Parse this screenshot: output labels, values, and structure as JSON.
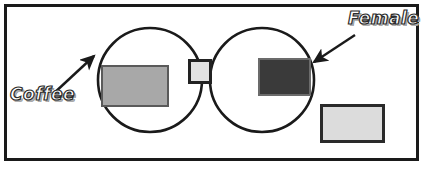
{
  "diagram": {
    "type": "venn-diagram",
    "title_visible": false,
    "set_count": 2,
    "frame": {
      "border_color": "#1a1a1a",
      "background_color": "#ffffff"
    },
    "labels": [
      {
        "id": "coffee",
        "text": "Coffee",
        "style": "bold-italic-outline-wordart",
        "points_to": "left-circle"
      },
      {
        "id": "female",
        "text": "Female",
        "style": "bold-italic-outline-wordart",
        "points_to": "right-circle"
      }
    ],
    "circles": [
      {
        "id": "left-circle",
        "label": "Coffee",
        "center_x": 150,
        "center_y": 80,
        "radius": 52,
        "stroke_color": "#1a1a1a",
        "fill": "none"
      },
      {
        "id": "right-circle",
        "label": "Female",
        "center_x": 262,
        "center_y": 80,
        "radius": 52,
        "stroke_color": "#1a1a1a",
        "fill": "none"
      }
    ],
    "regions": [
      {
        "id": "coffee-only",
        "name": "Coffee only",
        "shape": "rectangle",
        "fill_color": "#a8a8a8",
        "border_color": "#5a5a5a",
        "tone": "medium gray"
      },
      {
        "id": "intersection",
        "name": "Coffee and Female",
        "shape": "square",
        "fill_color": "#e2e2e2",
        "border_color": "#222222",
        "tone": "light gray"
      },
      {
        "id": "female-only",
        "name": "Female only",
        "shape": "rectangle",
        "fill_color": "#3a3a3a",
        "border_color": "#6b6b6b",
        "tone": "dark gray"
      },
      {
        "id": "outside",
        "name": "Neither Coffee nor Female",
        "shape": "rectangle",
        "fill_color": "#dcdcdc",
        "border_color": "#2a2a2a",
        "tone": "very light gray"
      }
    ],
    "arrows": [
      {
        "id": "coffee-arrow",
        "from_label": "Coffee",
        "to_target": "left-circle",
        "color": "#1a1a1a",
        "direction": "up-right"
      },
      {
        "id": "female-arrow",
        "from_label": "Female",
        "to_target": "right-circle",
        "color": "#1a1a1a",
        "direction": "down-left"
      }
    ]
  }
}
